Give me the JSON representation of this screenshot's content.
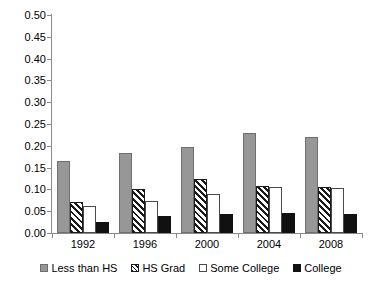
{
  "chart_data": {
    "type": "bar",
    "title": "",
    "subtitle": "",
    "xlabel": "",
    "ylabel": "",
    "categories": [
      "1992",
      "1996",
      "2000",
      "2004",
      "2008"
    ],
    "series": [
      {
        "name": "Less than HS",
        "values": [
          0.165,
          0.184,
          0.198,
          0.229,
          0.221
        ]
      },
      {
        "name": "HS Grad",
        "values": [
          0.07,
          0.1,
          0.125,
          0.107,
          0.106
        ]
      },
      {
        "name": "Some College",
        "values": [
          0.061,
          0.074,
          0.09,
          0.105,
          0.103
        ]
      },
      {
        "name": "College",
        "values": [
          0.026,
          0.038,
          0.044,
          0.047,
          0.044
        ]
      }
    ],
    "ylim": [
      0.0,
      0.5
    ],
    "ytick_labels": [
      "0.00",
      "0.05",
      "0.10",
      "0.15",
      "0.20",
      "0.25",
      "0.30",
      "0.35",
      "0.40",
      "0.45",
      "0.50"
    ],
    "ytick_values": [
      0.0,
      0.05,
      0.1,
      0.15,
      0.2,
      0.25,
      0.3,
      0.35,
      0.4,
      0.45,
      0.5
    ],
    "grid": false,
    "legend_position": "bottom"
  },
  "legend": {
    "items": [
      {
        "label": "Less than HS"
      },
      {
        "label": "HS Grad"
      },
      {
        "label": "Some College"
      },
      {
        "label": "College"
      }
    ]
  }
}
